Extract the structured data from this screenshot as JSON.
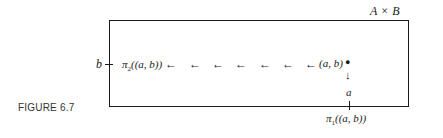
{
  "figure": {
    "caption": "FIGURE 6.7",
    "set_label": {
      "left": "A",
      "op": "×",
      "right": "B"
    },
    "left_axis_label": "b",
    "projection2": {
      "symbol": "π",
      "sub": "2",
      "arg": "((a, b))"
    },
    "point_label": "(a, b)",
    "bottom_marker_label": "a",
    "projection1": {
      "symbol": "π",
      "sub": "1",
      "arg": "((a, b))"
    },
    "arrow_count": 7,
    "arrow_glyph": "←",
    "down_arrow_glyph": "↓",
    "point_glyph": "●"
  }
}
